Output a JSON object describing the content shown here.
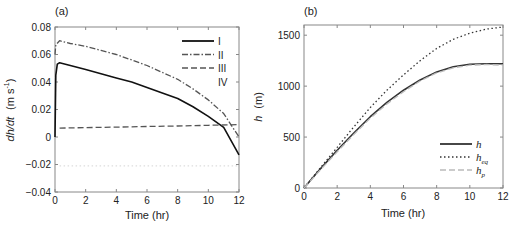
{
  "chart_data": [
    {
      "panel": "(a)",
      "type": "line",
      "xlabel": "Time (hr)",
      "ylabel": "dh/dt (m s^-1)",
      "ylabel_parts": {
        "var": "dh/dt",
        "unit": "(m s",
        "exp": "-1",
        "close": ")"
      },
      "xlim": [
        0,
        12
      ],
      "ylim": [
        -0.04,
        0.08
      ],
      "xticks": [
        0,
        2,
        4,
        6,
        8,
        10,
        12
      ],
      "yticks": [
        -0.04,
        -0.02,
        0,
        0.02,
        0.04,
        0.06,
        0.08
      ],
      "ytick_labels": [
        "−0.04",
        "−0.02",
        "0",
        "0.02",
        "0.04",
        "0.06",
        "0.08"
      ],
      "legend_position": "upper right",
      "grid": false,
      "series": [
        {
          "name": "I",
          "style": "solid",
          "color": "#111111",
          "x": [
            0,
            0.05,
            0.15,
            0.3,
            1,
            2,
            3,
            4,
            5,
            6,
            7,
            8,
            9,
            10,
            11,
            12
          ],
          "values": [
            0.0,
            0.045,
            0.053,
            0.054,
            0.052,
            0.049,
            0.046,
            0.043,
            0.04,
            0.036,
            0.032,
            0.028,
            0.022,
            0.015,
            0.007,
            -0.013
          ]
        },
        {
          "name": "II",
          "style": "dashdot",
          "color": "#555555",
          "x": [
            0,
            0.05,
            0.3,
            1,
            2,
            3,
            4,
            5,
            6,
            7,
            8,
            9,
            10,
            11,
            12
          ],
          "values": [
            0.06,
            0.067,
            0.07,
            0.068,
            0.066,
            0.063,
            0.06,
            0.056,
            0.052,
            0.047,
            0.042,
            0.035,
            0.027,
            0.017,
            0.0
          ]
        },
        {
          "name": "III",
          "style": "dashed",
          "color": "#555555",
          "x": [
            0.3,
            2,
            4,
            6,
            8,
            10,
            12
          ],
          "values": [
            0.0065,
            0.0068,
            0.0072,
            0.0076,
            0.008,
            0.0085,
            0.009
          ]
        },
        {
          "name": "IV",
          "style": "dotted",
          "color": "#dddddd",
          "x": [
            0.3,
            12
          ],
          "values": [
            -0.021,
            -0.021
          ]
        }
      ]
    },
    {
      "panel": "(b)",
      "type": "line",
      "xlabel": "Time (hr)",
      "ylabel": "h (m)",
      "ylabel_parts": {
        "var": "h",
        "unit": "(m)"
      },
      "xlim": [
        0,
        12
      ],
      "ylim": [
        0,
        1600
      ],
      "xticks": [
        0,
        2,
        4,
        6,
        8,
        10,
        12
      ],
      "yticks": [
        0,
        500,
        1000,
        1500
      ],
      "ytick_labels": [
        "0",
        "500",
        "1000",
        "1500"
      ],
      "legend_position": "lower right",
      "grid": false,
      "series": [
        {
          "name": "h",
          "sub": "",
          "style": "solid",
          "color": "#333333",
          "x": [
            0,
            1,
            2,
            3,
            4,
            5,
            6,
            7,
            8,
            9,
            10,
            11,
            12
          ],
          "values": [
            0,
            190,
            370,
            540,
            700,
            840,
            960,
            1060,
            1140,
            1190,
            1215,
            1220,
            1220
          ]
        },
        {
          "name": "h",
          "sub": "eq",
          "style": "dotted",
          "color": "#333333",
          "x": [
            0,
            1,
            2,
            3,
            4,
            5,
            6,
            7,
            8,
            9,
            10,
            11,
            12
          ],
          "values": [
            0,
            200,
            400,
            600,
            790,
            960,
            1110,
            1250,
            1370,
            1460,
            1520,
            1560,
            1580
          ]
        },
        {
          "name": "h",
          "sub": "p",
          "style": "dashed",
          "color": "#bbbbbb",
          "x": [
            0,
            1,
            2,
            3,
            4,
            5,
            6,
            7,
            8,
            9,
            10,
            11,
            12
          ],
          "values": [
            0,
            180,
            355,
            525,
            685,
            825,
            945,
            1050,
            1130,
            1180,
            1205,
            1212,
            1205
          ]
        }
      ]
    }
  ]
}
